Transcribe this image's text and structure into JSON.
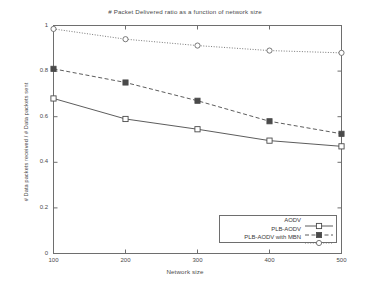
{
  "chart_data": {
    "type": "line",
    "title": "# Packet Delivered ratio as a function of network size",
    "xlabel": "Network size",
    "ylabel": "# Data packets received / # Data packets sent",
    "x": [
      100,
      200,
      300,
      400,
      500
    ],
    "xtick_labels": [
      "100",
      "200",
      "300",
      "400",
      "500"
    ],
    "ytick_labels": [
      "0",
      "0.2",
      "0.4",
      "0.6",
      "0.8",
      "1"
    ],
    "ytick_values": [
      0,
      0.2,
      0.4,
      0.6,
      0.8,
      1
    ],
    "xlim": [
      100,
      500
    ],
    "ylim": [
      0,
      1
    ],
    "grid": false,
    "legend_position": "bottom-right",
    "series": [
      {
        "name": "AODV",
        "values": [
          0.68,
          0.59,
          0.545,
          0.495,
          0.47
        ],
        "line_style": "solid",
        "marker": "open-square",
        "color": "#4a4a4a"
      },
      {
        "name": "PLB-AODV",
        "values": [
          0.81,
          0.75,
          0.67,
          0.58,
          0.525
        ],
        "line_style": "dashed",
        "marker": "filled-square",
        "color": "#4a4a4a"
      },
      {
        "name": "PLB-AODV with MBN",
        "values": [
          0.985,
          0.94,
          0.912,
          0.89,
          0.88
        ],
        "line_style": "dotted",
        "marker": "open-circle",
        "color": "#6a6a6a"
      }
    ]
  },
  "axes": {
    "frame_color": "#6e6e6e"
  }
}
